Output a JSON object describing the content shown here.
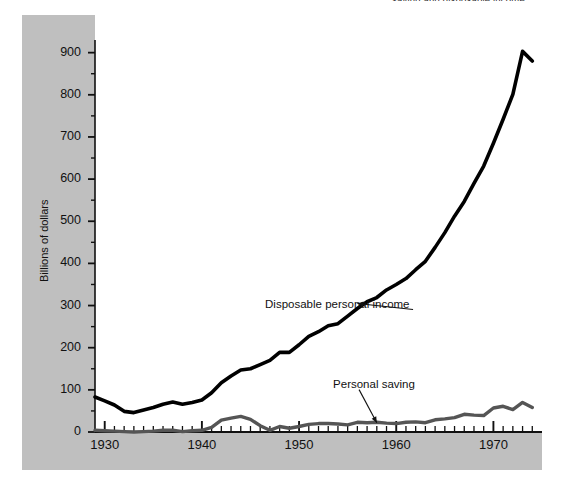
{
  "figure": {
    "suptitle": "saving and disposable income",
    "background_color": "#ffffff",
    "band_color": "#bfbfbf"
  },
  "chart_data": {
    "type": "line",
    "title": "",
    "xlabel": "",
    "ylabel": "Billions of dollars",
    "xlim": [
      1929,
      1975
    ],
    "ylim": [
      0,
      930
    ],
    "yticks": [
      0,
      100,
      200,
      300,
      400,
      500,
      600,
      700,
      800,
      900
    ],
    "ytick_labels": [
      "0",
      "100",
      "200",
      "300",
      "400",
      "500",
      "600",
      "700",
      "800",
      "900"
    ],
    "xticks": [
      1930,
      1940,
      1950,
      1960,
      1970
    ],
    "xtick_labels": [
      "1930",
      "1940",
      "1950",
      "1960",
      "1970"
    ],
    "minor_xtick_interval": 1,
    "minor_ytick_interval": 50,
    "grid": false,
    "legend": "inline-annotations",
    "series": [
      {
        "name": "Disposable personal income",
        "color": "#000000",
        "linewidth": 3.6,
        "annotation": {
          "text": "Disposable personal income",
          "x": 1946.5,
          "y": 300,
          "pointer_x": 1956,
          "pointer_y": 305
        },
        "x": [
          1929,
          1930,
          1931,
          1932,
          1933,
          1934,
          1935,
          1936,
          1937,
          1938,
          1939,
          1940,
          1941,
          1942,
          1943,
          1944,
          1945,
          1946,
          1947,
          1948,
          1949,
          1950,
          1951,
          1952,
          1953,
          1954,
          1955,
          1956,
          1957,
          1958,
          1959,
          1960,
          1961,
          1962,
          1963,
          1964,
          1965,
          1966,
          1967,
          1968,
          1969,
          1970,
          1971,
          1972,
          1973,
          1974
        ],
        "values": [
          83,
          74,
          64,
          49,
          46,
          52,
          58,
          66,
          71,
          66,
          70,
          76,
          93,
          117,
          133,
          147,
          150,
          160,
          170,
          189,
          189,
          207,
          227,
          238,
          252,
          257,
          275,
          293,
          309,
          319,
          337,
          350,
          364,
          385,
          405,
          438,
          473,
          512,
          547,
          590,
          631,
          685,
          742,
          801,
          903,
          880
        ]
      },
      {
        "name": "Personal saving",
        "color": "#555555",
        "linewidth": 3.4,
        "annotation": {
          "text": "Personal saving",
          "x": 1953.5,
          "y": 110,
          "pointer_x": 1958,
          "pointer_y": 22
        },
        "x": [
          1929,
          1930,
          1931,
          1932,
          1933,
          1934,
          1935,
          1936,
          1937,
          1938,
          1939,
          1940,
          1941,
          1942,
          1943,
          1944,
          1945,
          1946,
          1947,
          1948,
          1949,
          1950,
          1951,
          1952,
          1953,
          1954,
          1955,
          1956,
          1957,
          1958,
          1959,
          1960,
          1961,
          1962,
          1963,
          1964,
          1965,
          1966,
          1967,
          1968,
          1969,
          1970,
          1971,
          1972,
          1973,
          1974
        ],
        "values": [
          4,
          3,
          2,
          1,
          0,
          1,
          2,
          4,
          4,
          1,
          3,
          4,
          11,
          28,
          33,
          37,
          30,
          15,
          4,
          13,
          9,
          13,
          18,
          20,
          20,
          19,
          17,
          23,
          22,
          23,
          21,
          20,
          23,
          24,
          22,
          29,
          31,
          34,
          42,
          40,
          39,
          57,
          61,
          53,
          70,
          58
        ]
      }
    ]
  },
  "axes": {
    "y_axis_title": "Billions of dollars"
  }
}
